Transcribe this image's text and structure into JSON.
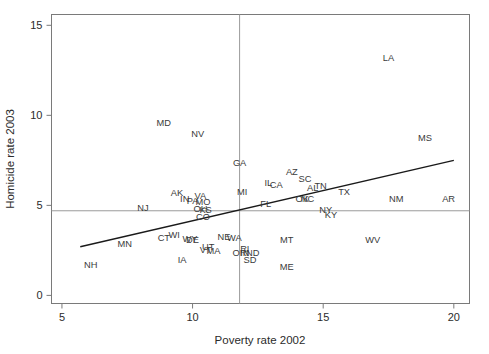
{
  "chart_data": {
    "type": "scatter",
    "title": "",
    "xlabel": "Poverty rate 2002",
    "ylabel": "Homicide rate 2003",
    "xlim": [
      4.6,
      20.6
    ],
    "ylim": [
      -0.45,
      15.6
    ],
    "xticks": [
      5,
      10,
      15,
      20
    ],
    "yticks": [
      0,
      5,
      10,
      15
    ],
    "grid": false,
    "legend": "none",
    "point_style": "text-labels-only",
    "annotations": {
      "regression_line": {
        "x": [
          5.7,
          20.0
        ],
        "y": [
          2.7,
          7.5
        ],
        "color": "#1a1a1a"
      },
      "reference_lines": [
        {
          "orientation": "horizontal",
          "y": 4.7,
          "color": "#9a9a9a"
        },
        {
          "orientation": "vertical",
          "x": 11.8,
          "color": "#9a9a9a"
        }
      ]
    },
    "labels": [
      "state"
    ],
    "points": [
      {
        "state": "LA",
        "x": 17.5,
        "y": 13.0
      },
      {
        "state": "MD",
        "x": 8.9,
        "y": 9.4
      },
      {
        "state": "NV",
        "x": 10.2,
        "y": 8.8
      },
      {
        "state": "MS",
        "x": 18.9,
        "y": 8.6
      },
      {
        "state": "GA",
        "x": 11.8,
        "y": 7.2
      },
      {
        "state": "AZ",
        "x": 13.8,
        "y": 6.7
      },
      {
        "state": "SC",
        "x": 14.3,
        "y": 6.3
      },
      {
        "state": "IL",
        "x": 12.9,
        "y": 6.1
      },
      {
        "state": "CA",
        "x": 13.2,
        "y": 5.95
      },
      {
        "state": "TN",
        "x": 14.9,
        "y": 5.9
      },
      {
        "state": "AL",
        "x": 14.6,
        "y": 5.8
      },
      {
        "state": "TX",
        "x": 15.8,
        "y": 5.6
      },
      {
        "state": "MI",
        "x": 11.9,
        "y": 5.6
      },
      {
        "state": "NM",
        "x": 17.8,
        "y": 5.2
      },
      {
        "state": "AR",
        "x": 19.8,
        "y": 5.2
      },
      {
        "state": "NC",
        "x": 14.4,
        "y": 5.2
      },
      {
        "state": "OK",
        "x": 14.2,
        "y": 5.2
      },
      {
        "state": "AK",
        "x": 9.4,
        "y": 5.5
      },
      {
        "state": "VA",
        "x": 10.3,
        "y": 5.35
      },
      {
        "state": "IN",
        "x": 9.7,
        "y": 5.2
      },
      {
        "state": "PA",
        "x": 10.0,
        "y": 5.1
      },
      {
        "state": "FL",
        "x": 12.8,
        "y": 4.9
      },
      {
        "state": "MO",
        "x": 10.4,
        "y": 5.0
      },
      {
        "state": "NJ",
        "x": 8.1,
        "y": 4.7
      },
      {
        "state": "OH",
        "x": 10.3,
        "y": 4.65
      },
      {
        "state": "KS",
        "x": 10.5,
        "y": 4.6
      },
      {
        "state": "NY",
        "x": 15.1,
        "y": 4.55
      },
      {
        "state": "KY",
        "x": 15.3,
        "y": 4.3
      },
      {
        "state": "CO",
        "x": 10.4,
        "y": 4.2
      },
      {
        "state": "WI",
        "x": 9.3,
        "y": 3.2
      },
      {
        "state": "CT",
        "x": 8.9,
        "y": 3.0
      },
      {
        "state": "WY",
        "x": 9.9,
        "y": 2.95
      },
      {
        "state": "DE",
        "x": 10.0,
        "y": 2.9
      },
      {
        "state": "NE",
        "x": 11.2,
        "y": 3.1
      },
      {
        "state": "WA",
        "x": 11.6,
        "y": 3.0
      },
      {
        "state": "MT",
        "x": 13.6,
        "y": 2.9
      },
      {
        "state": "WV",
        "x": 16.9,
        "y": 2.9
      },
      {
        "state": "MN",
        "x": 7.4,
        "y": 2.7
      },
      {
        "state": "UT",
        "x": 10.6,
        "y": 2.5
      },
      {
        "state": "VT",
        "x": 10.5,
        "y": 2.35
      },
      {
        "state": "MA",
        "x": 10.8,
        "y": 2.3
      },
      {
        "state": "RI",
        "x": 12.0,
        "y": 2.4
      },
      {
        "state": "OR",
        "x": 11.8,
        "y": 2.2
      },
      {
        "state": "IN2",
        "x": 12.0,
        "y": 2.2
      },
      {
        "state": "ND",
        "x": 12.3,
        "y": 2.2
      },
      {
        "state": "IA",
        "x": 9.6,
        "y": 1.8
      },
      {
        "state": "SD",
        "x": 12.2,
        "y": 1.8
      },
      {
        "state": "NH",
        "x": 6.1,
        "y": 1.5
      },
      {
        "state": "ME",
        "x": 13.6,
        "y": 1.4
      }
    ]
  },
  "axes": {
    "x_title": "Poverty rate 2002",
    "y_title": "Homicide rate 2003",
    "x_tick_labels": [
      "5",
      "10",
      "15",
      "20"
    ],
    "y_tick_labels": [
      "0",
      "5",
      "10",
      "15"
    ]
  },
  "colors": {
    "frame": "#7a7a7a",
    "reference_line": "#9a9a9a",
    "fit_line": "#1a1a1a",
    "text": "#2b2b2b",
    "background": "#ffffff"
  }
}
